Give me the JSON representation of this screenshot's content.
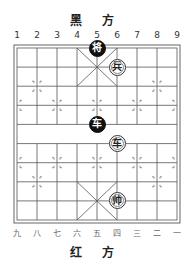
{
  "board": {
    "top_side_label": "黑 方",
    "bottom_side_label": "红 方",
    "top_column_labels": [
      "1",
      "2",
      "3",
      "4",
      "5",
      "6",
      "7",
      "8",
      "9"
    ],
    "bottom_column_labels": [
      "九",
      "八",
      "七",
      "六",
      "五",
      "四",
      "三",
      "二",
      "一"
    ]
  },
  "pieces": [
    {
      "side": "black",
      "char": "将",
      "name": "black-general",
      "col": 5,
      "row": 0
    },
    {
      "side": "red",
      "char": "兵",
      "name": "red-soldier",
      "col": 6,
      "row": 1
    },
    {
      "side": "black",
      "char": "车",
      "name": "black-chariot",
      "col": 5,
      "row": 4
    },
    {
      "side": "red",
      "char": "车",
      "name": "red-chariot",
      "col": 6,
      "row": 5
    },
    {
      "side": "red",
      "char": "帅",
      "name": "red-general",
      "col": 6,
      "row": 8
    }
  ]
}
